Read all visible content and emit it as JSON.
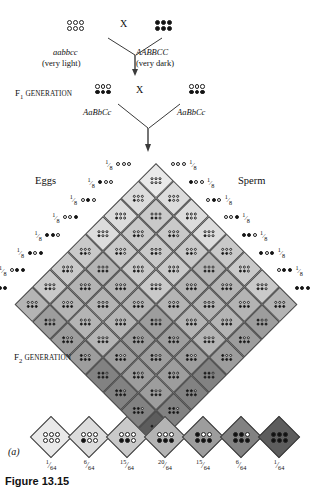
{
  "figure": {
    "caption": "Figure 13.15",
    "panel_letter": "(a)"
  },
  "parental": {
    "left": {
      "genotype": "aabbcc",
      "phenotype": "(very light)",
      "dominant_alleles": 0,
      "shade": "#e9e9e9"
    },
    "right": {
      "genotype": "AABBCC",
      "phenotype": "(very dark)",
      "dominant_alleles": 6,
      "shade": "#5d5d5d"
    },
    "cross_symbol": "X"
  },
  "f1": {
    "label_prefix": "F",
    "label_subscript": "1",
    "label_suffix": " GENERATION",
    "label_full": "F1 GENERATION",
    "left_genotype": "AaBbCc",
    "right_genotype": "AaBbCc",
    "dominant_alleles": 3,
    "shade": "#b4b4b4",
    "cross_symbol": "X"
  },
  "f2": {
    "label_prefix": "F",
    "label_subscript": "2",
    "label_suffix": " GENERATION",
    "label_full": "F2 GENERATION"
  },
  "axes": {
    "eggs_label": "Eggs",
    "sperm_label": "Sperm",
    "gamete_frequency": "1/8",
    "gamete_frequency_numerator": "1",
    "gamete_frequency_denominator": "8"
  },
  "gametes": {
    "count": 8,
    "note": "each gamete carries 3 alleles shown as 3 circles; filled = dominant",
    "patterns": [
      [
        0,
        0,
        0
      ],
      [
        1,
        0,
        0
      ],
      [
        0,
        1,
        0
      ],
      [
        0,
        0,
        1
      ],
      [
        1,
        1,
        0
      ],
      [
        1,
        0,
        1
      ],
      [
        0,
        1,
        1
      ],
      [
        1,
        1,
        1
      ]
    ]
  },
  "chart_data": {
    "type": "table",
    "xlabel": "Number of dominant (dark) alleles",
    "ylabel": "Frequency out of 64",
    "categories": [
      "0",
      "1",
      "2",
      "3",
      "4",
      "5",
      "6"
    ],
    "values": [
      1,
      6,
      15,
      20,
      15,
      6,
      1
    ],
    "grid_size": 8,
    "total_cells": 64,
    "phenotype_classes": [
      {
        "dominant_alleles": 0,
        "fraction": "1/64",
        "numerator": "1",
        "denominator": "64",
        "shade": "#e9e9e9"
      },
      {
        "dominant_alleles": 1,
        "fraction": "6/64",
        "numerator": "6",
        "denominator": "64",
        "shade": "#dcdcdc"
      },
      {
        "dominant_alleles": 2,
        "fraction": "15/64",
        "numerator": "15",
        "denominator": "64",
        "shade": "#c9c9c9"
      },
      {
        "dominant_alleles": 3,
        "fraction": "20/64",
        "numerator": "20",
        "denominator": "64",
        "shade": "#b4b4b4"
      },
      {
        "dominant_alleles": 4,
        "fraction": "15/64",
        "numerator": "15",
        "denominator": "64",
        "shade": "#9d9d9d"
      },
      {
        "dominant_alleles": 5,
        "fraction": "6/64",
        "numerator": "6",
        "denominator": "64",
        "shade": "#828282"
      },
      {
        "dominant_alleles": 6,
        "fraction": "1/64",
        "numerator": "1",
        "denominator": "64",
        "shade": "#5d5d5d"
      }
    ]
  }
}
